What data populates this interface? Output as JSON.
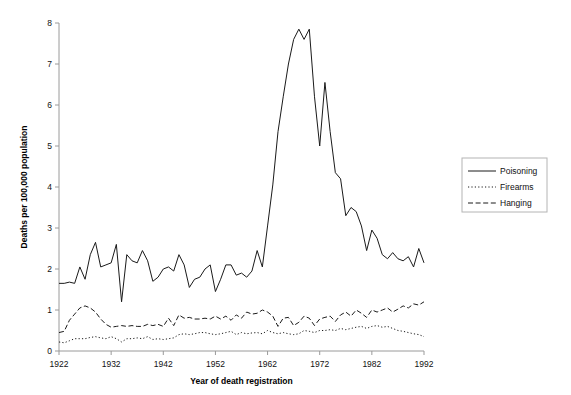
{
  "chart_data": {
    "type": "line",
    "title": "",
    "xlabel": "Year of death registration",
    "ylabel": "Deaths per 100,000 population",
    "xlim": [
      1922,
      1992
    ],
    "ylim": [
      0,
      8
    ],
    "xticks": [
      1922,
      1932,
      1942,
      1952,
      1962,
      1972,
      1982,
      1992
    ],
    "yticks": [
      0,
      1,
      2,
      3,
      4,
      5,
      6,
      7,
      8
    ],
    "grid": false,
    "legend_position": "right",
    "x": [
      1922,
      1923,
      1924,
      1925,
      1926,
      1927,
      1928,
      1929,
      1930,
      1931,
      1932,
      1933,
      1934,
      1935,
      1936,
      1937,
      1938,
      1939,
      1940,
      1941,
      1942,
      1943,
      1944,
      1945,
      1946,
      1947,
      1948,
      1949,
      1950,
      1951,
      1952,
      1953,
      1954,
      1955,
      1956,
      1957,
      1958,
      1959,
      1960,
      1961,
      1962,
      1963,
      1964,
      1965,
      1966,
      1967,
      1968,
      1969,
      1970,
      1971,
      1972,
      1973,
      1974,
      1975,
      1976,
      1977,
      1978,
      1979,
      1980,
      1981,
      1982,
      1983,
      1984,
      1985,
      1986,
      1987,
      1988,
      1989,
      1990,
      1991,
      1992
    ],
    "series": [
      {
        "name": "Poisoning",
        "style": "solid",
        "values": [
          1.65,
          1.65,
          1.68,
          1.65,
          2.05,
          1.75,
          2.35,
          2.65,
          2.05,
          2.1,
          2.15,
          2.6,
          1.2,
          2.35,
          2.2,
          2.15,
          2.45,
          2.2,
          1.7,
          1.8,
          2.0,
          2.05,
          1.95,
          2.35,
          2.1,
          1.55,
          1.75,
          1.8,
          2.0,
          2.1,
          1.45,
          1.75,
          2.1,
          2.1,
          1.85,
          1.9,
          1.8,
          1.95,
          2.45,
          2.05,
          3.05,
          4.05,
          5.35,
          6.2,
          7.0,
          7.6,
          7.85,
          7.6,
          7.85,
          6.2,
          5.0,
          6.55,
          5.35,
          4.35,
          4.2,
          3.3,
          3.5,
          3.4,
          3.05,
          2.45,
          2.95,
          2.75,
          2.35,
          2.25,
          2.4,
          2.25,
          2.2,
          2.3,
          2.05,
          2.5,
          2.15
        ]
      },
      {
        "name": "Firearms",
        "style": "dotted",
        "values": [
          0.22,
          0.2,
          0.25,
          0.3,
          0.3,
          0.3,
          0.33,
          0.35,
          0.32,
          0.3,
          0.35,
          0.3,
          0.22,
          0.3,
          0.3,
          0.32,
          0.3,
          0.35,
          0.28,
          0.3,
          0.28,
          0.3,
          0.32,
          0.4,
          0.42,
          0.4,
          0.42,
          0.45,
          0.45,
          0.42,
          0.4,
          0.42,
          0.45,
          0.48,
          0.4,
          0.45,
          0.42,
          0.44,
          0.45,
          0.42,
          0.5,
          0.45,
          0.42,
          0.45,
          0.42,
          0.4,
          0.42,
          0.5,
          0.48,
          0.45,
          0.5,
          0.5,
          0.52,
          0.5,
          0.55,
          0.52,
          0.55,
          0.58,
          0.6,
          0.55,
          0.6,
          0.62,
          0.58,
          0.6,
          0.55,
          0.5,
          0.48,
          0.45,
          0.42,
          0.4,
          0.35
        ]
      },
      {
        "name": "Hanging",
        "style": "dashed",
        "values": [
          0.45,
          0.48,
          0.75,
          0.9,
          1.05,
          1.1,
          1.05,
          0.95,
          0.78,
          0.65,
          0.58,
          0.6,
          0.62,
          0.6,
          0.62,
          0.6,
          0.6,
          0.65,
          0.62,
          0.65,
          0.6,
          0.8,
          0.62,
          0.88,
          0.8,
          0.82,
          0.78,
          0.78,
          0.8,
          0.78,
          0.85,
          0.78,
          0.85,
          0.75,
          0.88,
          0.8,
          0.95,
          0.9,
          0.92,
          1.0,
          0.95,
          0.85,
          0.6,
          0.8,
          0.82,
          0.62,
          0.7,
          0.85,
          0.8,
          0.62,
          0.78,
          0.82,
          0.85,
          0.72,
          0.88,
          0.95,
          0.85,
          1.0,
          0.92,
          0.82,
          1.0,
          0.95,
          1.0,
          1.05,
          0.95,
          1.02,
          1.1,
          1.05,
          1.15,
          1.12,
          1.2
        ]
      }
    ]
  },
  "legend": {
    "items": [
      {
        "label": "Poisoning",
        "style": "solid"
      },
      {
        "label": "Firearms",
        "style": "dotted"
      },
      {
        "label": "Hanging",
        "style": "dashed"
      }
    ]
  }
}
